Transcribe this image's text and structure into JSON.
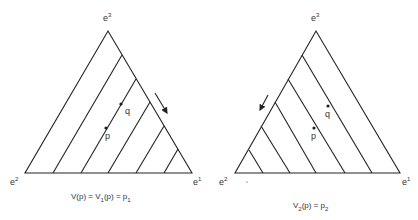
{
  "diagrams": [
    {
      "id": "left",
      "vertices": {
        "top": "e",
        "top_sup": "3",
        "left": "e",
        "left_sup": "2",
        "right": "e",
        "right_sup": "1"
      },
      "points": {
        "p": "p",
        "q": "q"
      },
      "caption": {
        "a": "V(p) = V",
        "a_sub": "1",
        "b": "(p) = p",
        "b_sub": "1"
      },
      "arrow_direction": "down-right along e3-e1 edge",
      "level_lines": "parallel to e3-e2 edge"
    },
    {
      "id": "right",
      "vertices": {
        "top": "e",
        "top_sup": "3",
        "left": "e",
        "left_sup": "2",
        "right": "e",
        "right_sup": "1"
      },
      "points": {
        "p": "p",
        "q": "q"
      },
      "caption": {
        "a": "V",
        "a_sub": "2",
        "b": "(p) = p",
        "b_sub": "2"
      },
      "arrow_direction": "down-left along e3-e2 edge",
      "level_lines": "parallel to e3-e1 edge"
    }
  ],
  "colors": {
    "line": "#222222",
    "background": "#ffffff"
  }
}
